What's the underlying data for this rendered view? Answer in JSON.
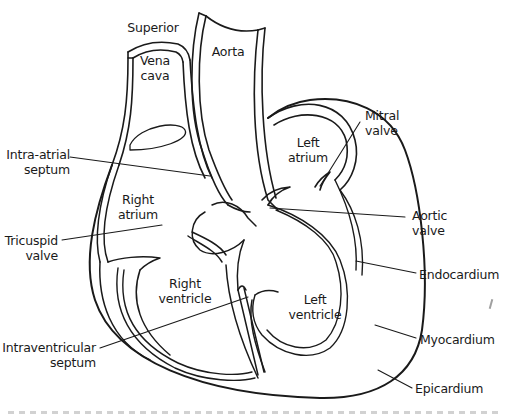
{
  "figure": {
    "stroke_color": "#1a1a1a",
    "background_color": "#ffffff"
  },
  "labels": {
    "superior": "Superior",
    "vena_cava_1": "Vena",
    "vena_cava_2": "cava",
    "aorta": "Aorta",
    "left_atrium_1": "Left",
    "left_atrium_2": "atrium",
    "mitral_valve_1": "Mitral",
    "mitral_valve_2": "valve",
    "intra_atrial_septum_1": "Intra-atrial",
    "intra_atrial_septum_2": "septum",
    "right_atrium_1": "Right",
    "right_atrium_2": "atrium",
    "aortic_valve_1": "Aortic",
    "aortic_valve_2": "valve",
    "tricuspid_valve_1": "Tricuspid",
    "tricuspid_valve_2": "valve",
    "endocardium": "Endocardium",
    "right_ventricle_1": "Right",
    "right_ventricle_2": "ventricle",
    "left_ventricle_1": "Left",
    "left_ventricle_2": "ventricle",
    "intraventricular_septum_1": "Intraventricular",
    "intraventricular_septum_2": "septum",
    "myocardium": "Myocardium",
    "epicardium": "Epicardium"
  }
}
